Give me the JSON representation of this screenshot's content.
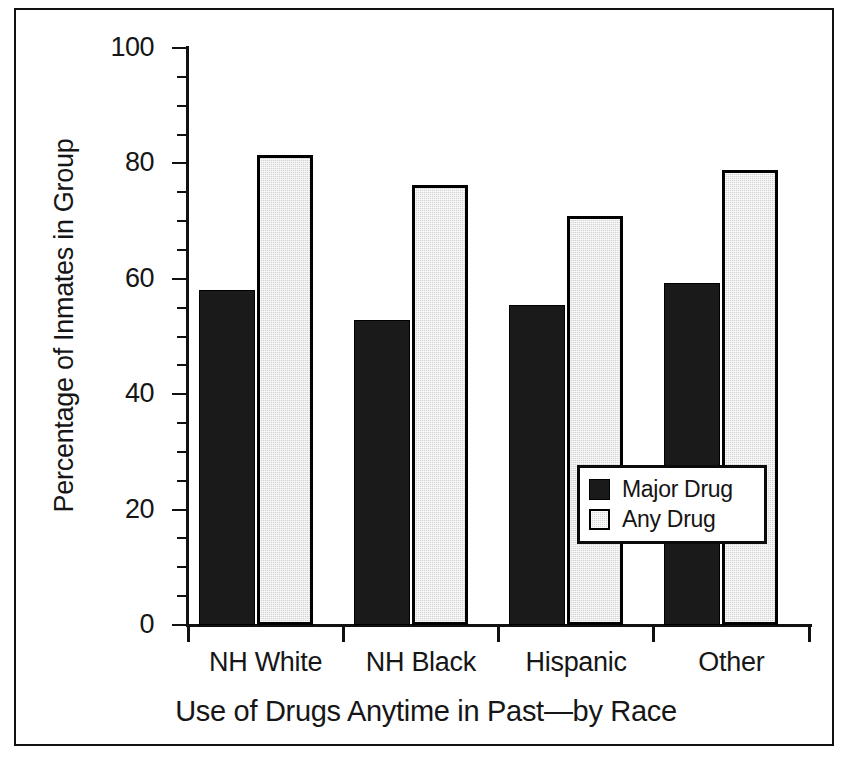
{
  "chart_data": {
    "type": "bar",
    "title": "",
    "xlabel": "Use of Drugs Anytime in Past—by Race",
    "ylabel": "Percentage of Inmates in Group",
    "categories": [
      "NH White",
      "NH Black",
      "Hispanic",
      "Other"
    ],
    "series": [
      {
        "name": "Major Drug",
        "color": "#1a1a1a",
        "values": [
          58.0,
          52.8,
          55.4,
          59.3
        ]
      },
      {
        "name": "Any Drug",
        "color": "#d4d4d4",
        "values": [
          81.5,
          76.3,
          70.8,
          78.8
        ]
      }
    ],
    "ylim": [
      0,
      100
    ],
    "y_major_ticks": [
      0,
      20,
      40,
      60,
      80,
      100
    ],
    "y_tick_labels": [
      "0",
      "20",
      "40",
      "60",
      "80",
      "100"
    ],
    "y_minor_tick_interval": 5,
    "grid": false,
    "legend_position": "inside-center-right",
    "frame": true
  },
  "legend": {
    "items": [
      {
        "label": "Major Drug",
        "swatch": "black-filled-square"
      },
      {
        "label": "Any Drug",
        "swatch": "gray-outlined-square"
      }
    ]
  },
  "axes": {
    "y_title": "Percentage of Inmates in Group",
    "x_title": "Use of Drugs Anytime in Past—by Race"
  }
}
